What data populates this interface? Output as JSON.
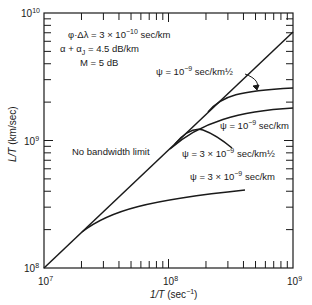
{
  "chart_data": {
    "type": "line",
    "title": "",
    "xlabel": "1/T (sec^-1)",
    "ylabel": "L/T (km/sec)",
    "xscale": "log",
    "yscale": "log",
    "xlim": [
      10000000.0,
      1000000000.0
    ],
    "ylim": [
      100000000.0,
      10000000000.0
    ],
    "grid": false,
    "x_tick_labels": [
      "10^7",
      "10^8",
      "10^9"
    ],
    "y_tick_labels": [
      "10^8",
      "10^9",
      "10^10"
    ],
    "parameters": [
      "φ·Δλ = 3 × 10^-10 sec/km",
      "α + αJ = 4.5 dB/km",
      "M = 5 dB"
    ],
    "series": [
      {
        "name": "No bandwidth limit",
        "x": [
          10000000.0,
          100000000.0,
          1000000000.0
        ],
        "y": [
          100000000.0,
          850000000.0,
          7000000000.0
        ]
      },
      {
        "name": "ψ = 10^-9 sec/km^1/2",
        "x": [
          220000000.0,
          300000000.0,
          500000000.0,
          1000000000.0
        ],
        "y": [
          1700000000.0,
          2200000000.0,
          2500000000.0,
          2600000000.0
        ]
      },
      {
        "name": "ψ = 10^-9 sec/km",
        "x": [
          100000000.0,
          150000000.0,
          300000000.0,
          600000000.0,
          1000000000.0
        ],
        "y": [
          900000000.0,
          1150000000.0,
          1500000000.0,
          1750000000.0,
          1850000000.0
        ]
      },
      {
        "name": "ψ = 3 × 10^-9 sec/km^1/2",
        "x": [
          110000000.0,
          140000000.0,
          180000000.0,
          240000000.0,
          300000000.0
        ],
        "y": [
          980000000.0,
          1050000000.0,
          1000000000.0,
          850000000.0,
          720000000.0
        ]
      },
      {
        "name": "ψ = 3 × 10^-9 sec/km",
        "x": [
          20000000.0,
          40000000.0,
          100000000.0,
          200000000.0,
          400000000.0
        ],
        "y": [
          200000000.0,
          320000000.0,
          460000000.0,
          560000000.0,
          620000000.0
        ]
      }
    ],
    "annotations": [
      "φ·Δλ = 3 × 10^-10 sec/km",
      "α + αJ = 4.5 dB/km",
      "M = 5 dB",
      "ψ = 10^-9 sec/km½",
      "ψ = 10^-9 sec/km",
      "No bandwidth limit",
      "ψ = 3 × 10^-9 sec/km½",
      "ψ = 3 × 10^-9 sec/km"
    ]
  },
  "labels": {
    "y_axis_title_main": "L/T",
    "y_axis_title_unit": " (km/sec)",
    "x_axis_title_main": "1/T",
    "x_axis_title_unit": " (sec",
    "x_axis_title_exp": "−1",
    "x_axis_title_close": ")",
    "ten": "10",
    "exp7": "7",
    "exp8": "8",
    "exp9": "9",
    "exp10": "10",
    "param1_a": "φ·Δλ = 3 × 10",
    "param1_exp": "−10",
    "param1_b": " sec/km",
    "param2_a": "α + α",
    "param2_sub": "J",
    "param2_b": " = 4.5 dB/km",
    "param3": "M = 5 dB",
    "curve_psi1_a": "ψ = 10",
    "curve_psi1_exp": "−9",
    "curve_psi1_b": " sec/km½",
    "curve_psi2_a": "ψ = 10",
    "curve_psi2_exp": "−9",
    "curve_psi2_b": " sec/km",
    "no_limit": "No bandwidth limit",
    "curve_psi3_a": "ψ = 3 × 10",
    "curve_psi3_exp": "−9",
    "curve_psi3_b": " sec/km½",
    "curve_psi4_a": "ψ = 3 × 10",
    "curve_psi4_exp": "−9",
    "curve_psi4_b": " sec/km"
  }
}
